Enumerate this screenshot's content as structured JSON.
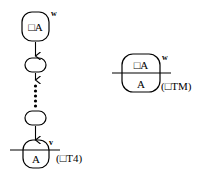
{
  "left_derivation": {
    "top_node": {
      "label": "□A",
      "superscript": "w"
    },
    "bottom_node": {
      "label": "A",
      "superscript": "v"
    },
    "rule_label": "(□T4)",
    "intermediate_nodes": 2,
    "ellipsis": "vertical-dots"
  },
  "right_rule": {
    "top_label": "□A",
    "bottom_label": "A",
    "superscript": "w",
    "rule_label": "(□TM)"
  },
  "colors": {
    "stroke": "#000000",
    "background": "#ffffff"
  }
}
